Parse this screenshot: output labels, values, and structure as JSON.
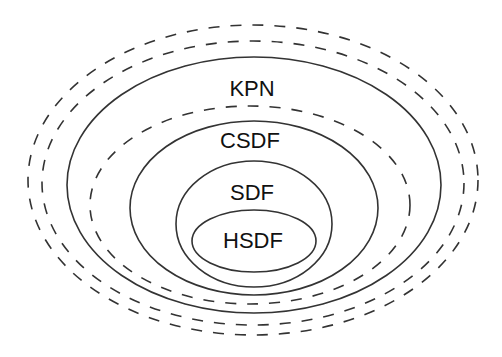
{
  "diagram": {
    "type": "nested-sets",
    "stroke_color": "#333333",
    "background": "#ffffff",
    "labels": {
      "kpn": "KPN",
      "csdf": "CSDF",
      "sdf": "SDF",
      "hsdf": "HSDF"
    },
    "sets": [
      {
        "name": "outer-dashed-1",
        "style": "dashed",
        "cx": 253,
        "cy": 180,
        "rx": 225,
        "ry": 155
      },
      {
        "name": "outer-dashed-2",
        "style": "dashed",
        "cx": 253,
        "cy": 183,
        "rx": 211,
        "ry": 142
      },
      {
        "name": "KPN",
        "style": "solid",
        "cx": 254,
        "cy": 185,
        "rx": 187,
        "ry": 128
      },
      {
        "name": "inner-dashed",
        "style": "dashed",
        "cx": 250,
        "cy": 205,
        "rx": 160,
        "ry": 99
      },
      {
        "name": "CSDF",
        "style": "solid",
        "cx": 254,
        "cy": 208,
        "rx": 124,
        "ry": 87
      },
      {
        "name": "SDF",
        "style": "solid",
        "cx": 254,
        "cy": 224,
        "rx": 78,
        "ry": 63
      },
      {
        "name": "HSDF",
        "style": "solid",
        "cx": 254,
        "cy": 241,
        "rx": 62,
        "ry": 31
      }
    ]
  }
}
